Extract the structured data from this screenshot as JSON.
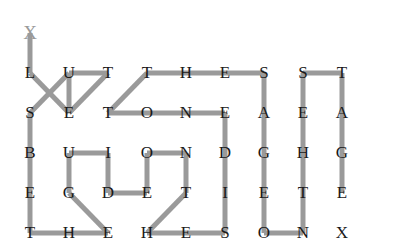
{
  "puzzle": {
    "title": "Letter Grid Path Puzzle",
    "canvas": {
      "width": 395,
      "height": 242,
      "background": "#ffffff"
    },
    "grid": {
      "columns": 9,
      "rows": 5,
      "origin_x": 30,
      "origin_y": 73,
      "col_step": 39,
      "row_step": 40,
      "letter_color": "#1a1a1a"
    },
    "rows": [
      {
        "row_index": 0,
        "letters": [
          "L",
          "U",
          "T",
          "T",
          "H",
          "E",
          "S",
          "S",
          "T"
        ]
      },
      {
        "row_index": 1,
        "letters": [
          "S",
          "E",
          "T",
          "O",
          "N",
          "E",
          "A",
          "E",
          "A"
        ]
      },
      {
        "row_index": 2,
        "letters": [
          "B",
          "U",
          "I",
          "O",
          "N",
          "D",
          "G",
          "H",
          "G"
        ]
      },
      {
        "row_index": 3,
        "letters": [
          "E",
          "G",
          "D",
          "E",
          "T",
          "I",
          "E",
          "T",
          "E"
        ]
      },
      {
        "row_index": 4,
        "letters": [
          "T",
          "H",
          "E",
          "H",
          "E",
          "S",
          "O",
          "N",
          "X"
        ]
      }
    ],
    "path": {
      "stroke_color": "#9a9a9a",
      "stroke_width": 5,
      "start_marker": {
        "glyph": "X",
        "col": 0,
        "row": -1,
        "color": "#9a9a9a",
        "label": "path-start-marker"
      },
      "end_marker": {
        "glyph": "X",
        "col": 8,
        "row": 4,
        "color": "#1a1a1a",
        "label": "path-end-letter"
      },
      "segments": [
        {
          "from": [
            0,
            -1
          ],
          "to": [
            0,
            0
          ],
          "name": "start-to-L"
        },
        {
          "from": [
            0,
            0
          ],
          "to": [
            1,
            1
          ],
          "name": "L-to-E"
        },
        {
          "from": [
            1,
            1
          ],
          "to": [
            1,
            0
          ],
          "name": "E-to-U"
        },
        {
          "from": [
            1,
            0
          ],
          "to": [
            0,
            1
          ],
          "name": "U-to-S"
        },
        {
          "from": [
            1,
            0
          ],
          "to": [
            2,
            0
          ],
          "name": "U-to-T"
        },
        {
          "from": [
            2,
            0
          ],
          "to": [
            1,
            1
          ],
          "name": "T-to-E-diag"
        },
        {
          "from": [
            2,
            1
          ],
          "to": [
            3,
            0
          ],
          "name": "T-to-T-diag"
        },
        {
          "from": [
            3,
            0
          ],
          "to": [
            4,
            0
          ],
          "name": "T-to-H"
        },
        {
          "from": [
            4,
            0
          ],
          "to": [
            5,
            0
          ],
          "name": "H-to-E"
        },
        {
          "from": [
            5,
            0
          ],
          "to": [
            6,
            0
          ],
          "name": "E-to-S"
        },
        {
          "from": [
            2,
            1
          ],
          "to": [
            3,
            1
          ],
          "name": "T-to-O"
        },
        {
          "from": [
            3,
            1
          ],
          "to": [
            4,
            1
          ],
          "name": "O-to-N"
        },
        {
          "from": [
            4,
            1
          ],
          "to": [
            5,
            1
          ],
          "name": "N-to-E"
        },
        {
          "from": [
            6,
            0
          ],
          "to": [
            6,
            1
          ],
          "name": "S-to-A"
        },
        {
          "from": [
            6,
            1
          ],
          "to": [
            6,
            2
          ],
          "name": "A-to-G"
        },
        {
          "from": [
            6,
            2
          ],
          "to": [
            6,
            3
          ],
          "name": "G-to-E"
        },
        {
          "from": [
            6,
            3
          ],
          "to": [
            6,
            4
          ],
          "name": "E-to-O"
        },
        {
          "from": [
            6,
            4
          ],
          "to": [
            7,
            4
          ],
          "name": "O-to-N"
        },
        {
          "from": [
            7,
            4
          ],
          "to": [
            7,
            3
          ],
          "name": "N-to-T"
        },
        {
          "from": [
            7,
            3
          ],
          "to": [
            7,
            2
          ],
          "name": "T-to-H"
        },
        {
          "from": [
            7,
            2
          ],
          "to": [
            7,
            1
          ],
          "name": "H-to-E"
        },
        {
          "from": [
            7,
            1
          ],
          "to": [
            7,
            0
          ],
          "name": "E-to-S"
        },
        {
          "from": [
            7,
            0
          ],
          "to": [
            8,
            0
          ],
          "name": "S-to-T"
        },
        {
          "from": [
            8,
            0
          ],
          "to": [
            8,
            1
          ],
          "name": "T-to-A"
        },
        {
          "from": [
            8,
            1
          ],
          "to": [
            8,
            2
          ],
          "name": "A-to-G"
        },
        {
          "from": [
            8,
            2
          ],
          "to": [
            8,
            3
          ],
          "name": "G-to-E-final"
        },
        {
          "from": [
            0,
            1
          ],
          "to": [
            0,
            2
          ],
          "name": "S-to-B"
        },
        {
          "from": [
            0,
            2
          ],
          "to": [
            0,
            3
          ],
          "name": "B-to-E"
        },
        {
          "from": [
            0,
            3
          ],
          "to": [
            0,
            4
          ],
          "name": "E-to-T"
        },
        {
          "from": [
            0,
            4
          ],
          "to": [
            1,
            4
          ],
          "name": "T-to-H"
        },
        {
          "from": [
            1,
            4
          ],
          "to": [
            2,
            4
          ],
          "name": "H-to-E"
        },
        {
          "from": [
            2,
            4
          ],
          "to": [
            1,
            3
          ],
          "name": "E-to-G-diag"
        },
        {
          "from": [
            1,
            3
          ],
          "to": [
            1,
            2
          ],
          "name": "G-to-U"
        },
        {
          "from": [
            1,
            2
          ],
          "to": [
            2,
            2
          ],
          "name": "U-to-I"
        },
        {
          "from": [
            2,
            2
          ],
          "to": [
            2,
            3
          ],
          "name": "I-to-D"
        },
        {
          "from": [
            2,
            3
          ],
          "to": [
            3,
            3
          ],
          "name": "D-to-E"
        },
        {
          "from": [
            3,
            3
          ],
          "to": [
            3,
            2
          ],
          "name": "E-to-O"
        },
        {
          "from": [
            3,
            2
          ],
          "to": [
            4,
            2
          ],
          "name": "O-to-N"
        },
        {
          "from": [
            4,
            2
          ],
          "to": [
            4,
            3
          ],
          "name": "N-to-T"
        },
        {
          "from": [
            4,
            3
          ],
          "to": [
            3,
            4
          ],
          "name": "T-to-H-diag"
        },
        {
          "from": [
            3,
            4
          ],
          "to": [
            4,
            4
          ],
          "name": "H-to-E"
        },
        {
          "from": [
            4,
            4
          ],
          "to": [
            5,
            4
          ],
          "name": "E-to-S"
        },
        {
          "from": [
            5,
            4
          ],
          "to": [
            5,
            3
          ],
          "name": "S-to-I"
        },
        {
          "from": [
            5,
            3
          ],
          "to": [
            5,
            2
          ],
          "name": "I-to-D"
        },
        {
          "from": [
            5,
            2
          ],
          "to": [
            5,
            1
          ],
          "name": "D-to-E"
        }
      ]
    }
  }
}
